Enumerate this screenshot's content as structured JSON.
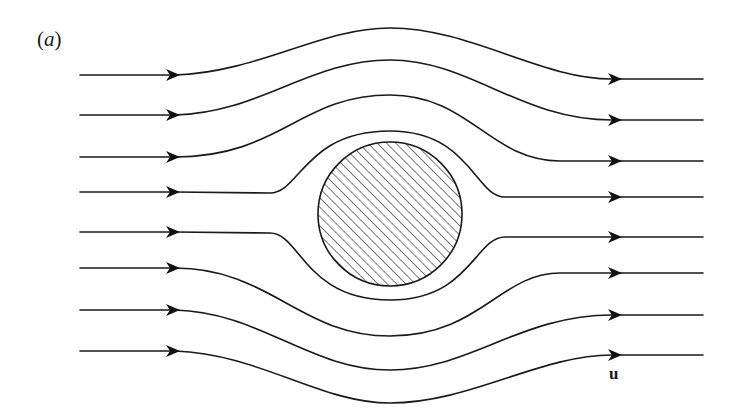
{
  "figure": {
    "panel_label_open": "(",
    "panel_label_letter": "a",
    "panel_label_close": ")",
    "velocity_label": "u",
    "obstacle": {
      "shape": "circle",
      "fill": "diagonal-hatching",
      "cx": 390,
      "cy": 214,
      "r": 72
    },
    "streamline_count": 8,
    "flow_direction": "left-to-right",
    "colors": {
      "line": "#1a1a1a",
      "background": "#ffffff"
    }
  }
}
